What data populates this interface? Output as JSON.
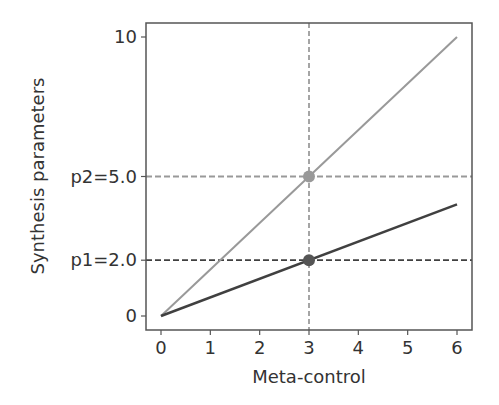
{
  "chart_data": {
    "type": "line",
    "title": "",
    "xlabel": "Meta-control",
    "ylabel": "Synthesis parameters",
    "xlim": [
      -0.3,
      6.3
    ],
    "ylim": [
      -0.5,
      10.5
    ],
    "grid": false,
    "x_ticks": [
      "0",
      "1",
      "2",
      "3",
      "4",
      "5",
      "6"
    ],
    "y_ticks": [
      {
        "value": 0,
        "label": "0"
      },
      {
        "value": 2,
        "label": "p1=2.0"
      },
      {
        "value": 5,
        "label": "p2=5.0"
      },
      {
        "value": 10,
        "label": "10"
      }
    ],
    "series": [
      {
        "name": "p2",
        "color": "#999999",
        "x": [
          0,
          6
        ],
        "y": [
          0,
          10
        ]
      },
      {
        "name": "p1",
        "color": "#404040",
        "x": [
          0,
          6
        ],
        "y": [
          0,
          4
        ]
      }
    ],
    "markers": [
      {
        "x": 3,
        "y": 5.0,
        "color": "#999999"
      },
      {
        "x": 3,
        "y": 2.0,
        "color": "#555555"
      }
    ],
    "reference_lines": [
      {
        "orientation": "vertical",
        "x": 3,
        "style": "dashed",
        "color": "#888888"
      },
      {
        "orientation": "horizontal",
        "y": 5.0,
        "style": "dashed",
        "color": "#999999"
      },
      {
        "orientation": "horizontal",
        "y": 2.0,
        "style": "dashed",
        "color": "#404040"
      }
    ]
  }
}
